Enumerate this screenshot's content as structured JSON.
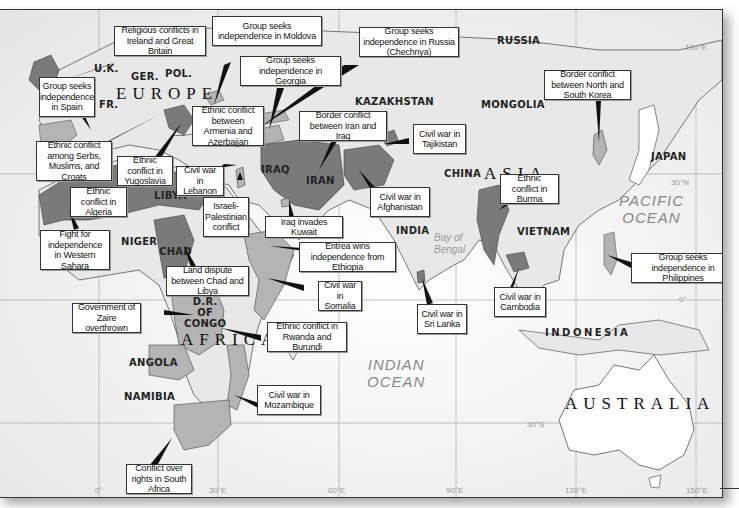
{
  "map": {
    "continents": {
      "europe": "EUROPE",
      "asia": "ASIA",
      "africa": "AFRICA",
      "australia": "AUSTRALIA"
    },
    "oceans": {
      "pacific_line1": "PACIFIC",
      "pacific_line2": "OCEAN",
      "indian_line1": "INDIAN",
      "indian_line2": "OCEAN",
      "bay_line1": "Bay of",
      "bay_line2": "Bengal"
    },
    "countries": {
      "uk": "U.K.",
      "germany": "GER.",
      "poland": "POL.",
      "france": "FR.",
      "russia": "RUSSIA",
      "kazakhstan": "KAZAKHSTAN",
      "mongolia": "MONGOLIA",
      "china": "CHINA",
      "japan": "JAPAN",
      "iraq": "IRAQ",
      "iran": "IRAN",
      "india": "INDIA",
      "vietnam": "VIETNAM",
      "indonesia": "INDONESIA",
      "libya": "LIBYA",
      "niger": "NIGER",
      "chad": "CHAD",
      "drc": "D.R.\nOF\nCONGO",
      "angola": "ANGOLA",
      "namibia": "NAMIBIA"
    },
    "grid_labels": {
      "lon_0": "0°",
      "lon_30e": "30°E",
      "lon_60e": "60°E",
      "lon_90e": "90°E",
      "lon_120e": "120°E",
      "lon_150e_bottom": "150°E",
      "lon_150e_top": "150°E",
      "lat_30n": "30°N",
      "lat_0": "0°",
      "lat_30s": "30°S"
    },
    "callouts": [
      {
        "id": "ireland",
        "text": "Religious conflicts in Ireland and Great Britain"
      },
      {
        "id": "moldova",
        "text": "Group seeks independence in Moldova"
      },
      {
        "id": "chechnya",
        "text": "Group seeks independence in Russia (Chechnya)"
      },
      {
        "id": "georgia",
        "text": "Group seeks independence in Georgia"
      },
      {
        "id": "spain",
        "text": "Group seeks independence in Spain"
      },
      {
        "id": "armenia",
        "text": "Ethnic conflict between Armenia and Azerbaijan"
      },
      {
        "id": "iran-iraq",
        "text": "Border conflict between Iran and Iraq"
      },
      {
        "id": "tajikistan",
        "text": "Civil war in Tajikistan"
      },
      {
        "id": "korea",
        "text": "Border conflict between North and South Korea"
      },
      {
        "id": "serbs",
        "text": "Ethnic conflict among Serbs, Muslims, and Croats"
      },
      {
        "id": "yugoslavia",
        "text": "Ethnic conflict in Yugoslavia"
      },
      {
        "id": "lebanon",
        "text": "Civil war in Lebanon"
      },
      {
        "id": "algeria",
        "text": "Ethnic conflict in Algeria"
      },
      {
        "id": "israel",
        "text": "Israeli-Palestinian conflict"
      },
      {
        "id": "afghanistan",
        "text": "Civil war in Afghanistan"
      },
      {
        "id": "burma",
        "text": "Ethnic conflict in Burma"
      },
      {
        "id": "kuwait",
        "text": "Iraq invades Kuwait"
      },
      {
        "id": "western-sahara",
        "text": "Fight for independence in Western Sahara"
      },
      {
        "id": "eritrea",
        "text": "Eritrea wins independence from Ethiopia"
      },
      {
        "id": "chad-libya",
        "text": "Land dispute between Chad and Libya"
      },
      {
        "id": "philippines",
        "text": "Group seeks independence in Philippines"
      },
      {
        "id": "somalia",
        "text": "Civil war in Somalia"
      },
      {
        "id": "sri-lanka",
        "text": "Civil war in Sri Lanka"
      },
      {
        "id": "cambodia",
        "text": "Civil war in Cambodia"
      },
      {
        "id": "zaire",
        "text": "Government of Zaire overthrown"
      },
      {
        "id": "rwanda",
        "text": "Ethnic conflict in Rwanda and Burundi"
      },
      {
        "id": "mozambique",
        "text": "Civil war in Mozambique"
      },
      {
        "id": "south-africa",
        "text": "Conflict over rights in South Africa"
      }
    ],
    "colors": {
      "ocean": "#f2f2f2",
      "land": "#e6e6e6",
      "conflict_dark": "#7a7a7a",
      "conflict_light": "#b4b4b4",
      "border": "#555555",
      "callout_border": "#333333"
    }
  }
}
